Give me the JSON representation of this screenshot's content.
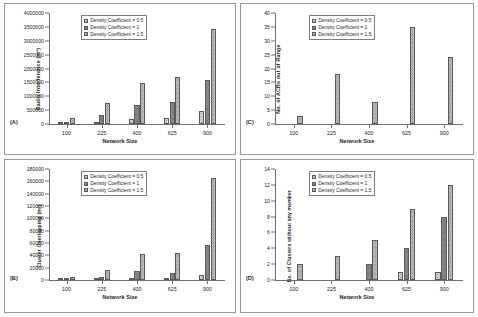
{
  "figure": {
    "series_names": [
      "Density Coefficient = 0.5",
      "Density Coefficient = 1",
      "Density Coefficient = 1.5"
    ],
    "categories": [
      "100",
      "225",
      "400",
      "625",
      "900"
    ],
    "xlabel": "Network Size"
  },
  "panels": {
    "a": {
      "letter": "(A)",
      "ylabel": "Radio Interference (m²)",
      "xlabel": "Network Size",
      "yticks": [
        "0",
        "500000",
        "1000000",
        "1500000",
        "2000000",
        "2500000",
        "3000000",
        "3500000",
        "4000000"
      ],
      "legend": [
        "Density Coefficient = 0.5",
        "Density Coefficient = 1",
        "Density Coefficient = 1.5"
      ]
    },
    "b": {
      "letter": "(B)",
      "ylabel": "Cluster Overlapping (m²)",
      "xlabel": "Network Size",
      "yticks": [
        "0",
        "20000",
        "40000",
        "60000",
        "80000",
        "100000",
        "120000",
        "140000",
        "160000",
        "180000"
      ],
      "legend": [
        "Density Coefficient = 0.5",
        "Density Coefficient = 1",
        "Density Coefficient = 1.5"
      ]
    },
    "c": {
      "letter": "(C)",
      "ylabel": "No. of ACBs out of Range",
      "xlabel": "Network Size",
      "yticks": [
        "0",
        "5",
        "10",
        "15",
        "20",
        "25",
        "30",
        "35",
        "40"
      ],
      "legend": [
        "Density Coefficient = 0.5",
        "Density Coefficient = 1",
        "Density Coefficient = 1.5"
      ]
    },
    "d": {
      "letter": "(D)",
      "ylabel": "No. of Clusters without any member",
      "xlabel": "Network Size",
      "yticks": [
        "0",
        "2",
        "4",
        "6",
        "8",
        "10",
        "12",
        "14"
      ],
      "legend": [
        "Density Coefficient = 0.5",
        "Density Coefficient = 1",
        "Density Coefficient = 1.5"
      ]
    }
  },
  "chart_data": [
    {
      "id": "a",
      "type": "bar",
      "title": "(A)",
      "xlabel": "Network Size",
      "ylabel": "Radio Interference (m²)",
      "categories": [
        "100",
        "225",
        "400",
        "625",
        "900"
      ],
      "ylim": [
        0,
        4000000
      ],
      "ytick_step": 500000,
      "grid": false,
      "legend_position": "top-left",
      "series": [
        {
          "name": "Density Coefficient = 0.5",
          "values": [
            30000,
            60000,
            170000,
            215000,
            470000
          ]
        },
        {
          "name": "Density Coefficient = 1",
          "values": [
            90000,
            330000,
            700000,
            810000,
            1590000
          ]
        },
        {
          "name": "Density Coefficient = 1.5",
          "values": [
            205000,
            755000,
            1490000,
            1710000,
            3420000
          ]
        }
      ]
    },
    {
      "id": "b",
      "type": "bar",
      "title": "(B)",
      "xlabel": "Network Size",
      "ylabel": "Cluster Overlapping (m²)",
      "categories": [
        "100",
        "225",
        "400",
        "625",
        "900"
      ],
      "ylim": [
        0,
        180000
      ],
      "ytick_step": 20000,
      "grid": false,
      "legend_position": "top-left",
      "series": [
        {
          "name": "Density Coefficient = 0.5",
          "values": [
            1000,
            1500,
            3000,
            4000,
            7500
          ]
        },
        {
          "name": "Density Coefficient = 1",
          "values": [
            2500,
            5500,
            15000,
            12000,
            56500
          ]
        },
        {
          "name": "Density Coefficient = 1.5",
          "values": [
            5500,
            16500,
            42000,
            43000,
            165000
          ]
        }
      ]
    },
    {
      "id": "c",
      "type": "bar",
      "title": "(C)",
      "xlabel": "Network Size",
      "ylabel": "No. of ACBs out of Range",
      "categories": [
        "100",
        "225",
        "400",
        "625",
        "900"
      ],
      "ylim": [
        0,
        40
      ],
      "ytick_step": 5,
      "grid": false,
      "legend_position": "top-left",
      "series": [
        {
          "name": "Density Coefficient = 0.5",
          "values": [
            0,
            0,
            0,
            0,
            0
          ]
        },
        {
          "name": "Density Coefficient = 1",
          "values": [
            0,
            0,
            0,
            0,
            0
          ]
        },
        {
          "name": "Density Coefficient = 1.5",
          "values": [
            3,
            18,
            8,
            35,
            24
          ]
        }
      ]
    },
    {
      "id": "d",
      "type": "bar",
      "title": "(D)",
      "xlabel": "Network Size",
      "ylabel": "No. of Clusters without any member",
      "categories": [
        "100",
        "225",
        "400",
        "625",
        "900"
      ],
      "ylim": [
        0,
        14
      ],
      "ytick_step": 2,
      "grid": false,
      "legend_position": "top-left",
      "series": [
        {
          "name": "Density Coefficient = 0.5",
          "values": [
            0,
            0,
            0,
            1,
            1
          ]
        },
        {
          "name": "Density Coefficient = 1",
          "values": [
            0,
            0,
            2,
            4,
            8
          ]
        },
        {
          "name": "Density Coefficient = 1.5",
          "values": [
            2,
            3,
            5,
            9,
            12
          ]
        }
      ]
    }
  ]
}
